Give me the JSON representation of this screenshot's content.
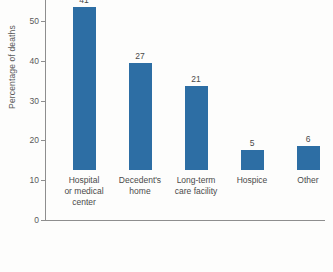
{
  "chart_data": {
    "type": "bar",
    "title": "",
    "xlabel": "",
    "ylabel": "Percentage of deaths",
    "categories": [
      "Hospital or medical center",
      "Decedent's home",
      "Long-term care facility",
      "Hospice",
      "Other"
    ],
    "category_lines": [
      [
        "Hospital",
        "or medical",
        "center"
      ],
      [
        "Decedent's",
        "home"
      ],
      [
        "Long-term",
        "care facility"
      ],
      [
        "Hospice"
      ],
      [
        "Other"
      ]
    ],
    "values": [
      41,
      27,
      21,
      5,
      6
    ],
    "value_labels": [
      "41",
      "27",
      "21",
      "5",
      "6"
    ],
    "ylim": [
      0,
      50
    ],
    "yticks": [
      0,
      10,
      20,
      30,
      40,
      50
    ],
    "ytick_labels": [
      "0",
      "10",
      "20",
      "30",
      "40",
      "50"
    ],
    "grid": false,
    "legend": false,
    "bar_color": "#2d6ea4",
    "axis_color": "#8e8e8e",
    "text_color": "#4a4a4a",
    "background_color": "#fdfdfc"
  }
}
